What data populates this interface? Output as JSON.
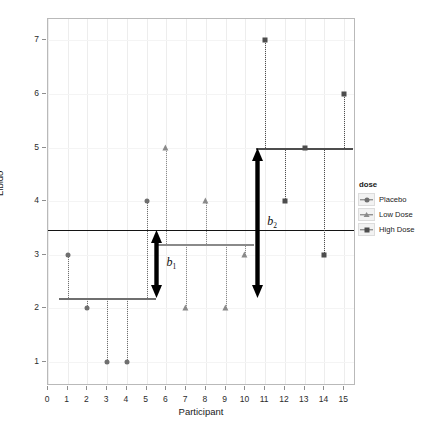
{
  "chart_data": {
    "type": "scatter",
    "title": "",
    "xlabel": "Participant",
    "ylabel": "Libido",
    "xlim": [
      0,
      15.6
    ],
    "ylim": [
      0.55,
      7.4
    ],
    "xticks": [
      "0",
      "1",
      "2",
      "3",
      "4",
      "5",
      "6",
      "7",
      "8",
      "9",
      "10",
      "11",
      "12",
      "13",
      "14",
      "15"
    ],
    "yticks": [
      "1",
      "2",
      "3",
      "4",
      "5",
      "6",
      "7"
    ],
    "grid": "vertical-faint",
    "legend_position": "right",
    "series": [
      {
        "name": "Placebo",
        "marker": "circle",
        "color": "#6f6f6f",
        "x": [
          1,
          2,
          3,
          4,
          5
        ],
        "y": [
          3,
          2,
          1,
          1,
          4
        ],
        "group_mean": 2.2,
        "mean_line_x": [
          0.55,
          5.45
        ]
      },
      {
        "name": "Low Dose",
        "marker": "triangle",
        "color": "#8a8a8a",
        "x": [
          6,
          7,
          8,
          9,
          10
        ],
        "y": [
          5,
          2,
          4,
          2,
          3
        ],
        "group_mean": 3.2,
        "mean_line_x": [
          5.55,
          10.45
        ]
      },
      {
        "name": "High Dose",
        "marker": "square",
        "color": "#4d4d4d",
        "x": [
          11,
          12,
          13,
          14,
          15
        ],
        "y": [
          7,
          4,
          5,
          3,
          6
        ],
        "group_mean": 5.0,
        "mean_line_x": [
          10.55,
          15.45
        ]
      }
    ],
    "grand_mean": 3.467,
    "annotations": [
      {
        "id": "b1",
        "label": "b",
        "subscript": "1",
        "from_y": 2.2,
        "to_y": 3.467,
        "at_x": 5.5
      },
      {
        "id": "b2",
        "label": "b",
        "subscript": "2",
        "from_y": 2.2,
        "to_y": 5.0,
        "at_x": 10.6
      }
    ]
  },
  "legend": {
    "title": "dose",
    "items": [
      {
        "label": "Placebo",
        "marker": "circle"
      },
      {
        "label": "Low Dose",
        "marker": "triangle"
      },
      {
        "label": "High Dose",
        "marker": "square"
      }
    ]
  },
  "axes": {
    "y_title": "Libido",
    "x_title": "Participant"
  }
}
